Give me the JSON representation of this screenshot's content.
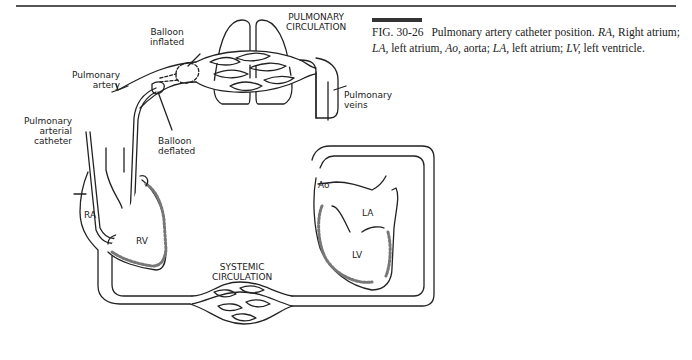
{
  "caption": {
    "figure_number": "FIG. 30-26",
    "segments": [
      {
        "text": "Pulmonary artery catheter position. ",
        "italic": false
      },
      {
        "text": "RA,",
        "italic": true
      },
      {
        "text": " Right atrium; ",
        "italic": false
      },
      {
        "text": "LA,",
        "italic": true
      },
      {
        "text": " left atrium, ",
        "italic": false
      },
      {
        "text": "Ao,",
        "italic": true
      },
      {
        "text": " aorta; ",
        "italic": false
      },
      {
        "text": "LA,",
        "italic": true
      },
      {
        "text": " left atrium; ",
        "italic": false
      },
      {
        "text": "LV,",
        "italic": true
      },
      {
        "text": " left ventricle.",
        "italic": false
      }
    ]
  },
  "diagram": {
    "labels": {
      "pulmonary_circulation": [
        "PULMONARY",
        "CIRCULATION"
      ],
      "systemic_circulation": [
        "SYSTEMIC",
        "CIRCULATION"
      ],
      "balloon_inflated": [
        "Balloon",
        "inflated"
      ],
      "balloon_deflated": [
        "Balloon",
        "deflated"
      ],
      "pulmonary_artery": [
        "Pulmonary",
        "artery"
      ],
      "pulmonary_arterial_catheter": [
        "Pulmonary",
        "arterial",
        "catheter"
      ],
      "pulmonary_veins": [
        "Pulmonary",
        "veins"
      ],
      "ra": "RA",
      "rv": "RV",
      "ao": "Ao",
      "la": "LA",
      "lv": "LV"
    }
  }
}
